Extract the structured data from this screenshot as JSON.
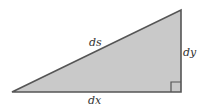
{
  "diagram": {
    "type": "right-triangle",
    "labels": {
      "hypotenuse": "ds",
      "vertical_leg": "dy",
      "horizontal_leg": "dx"
    },
    "colors": {
      "fill": "#c9c9c9",
      "stroke": "#555555",
      "label": "#333333"
    },
    "right_angle_marker": true
  }
}
